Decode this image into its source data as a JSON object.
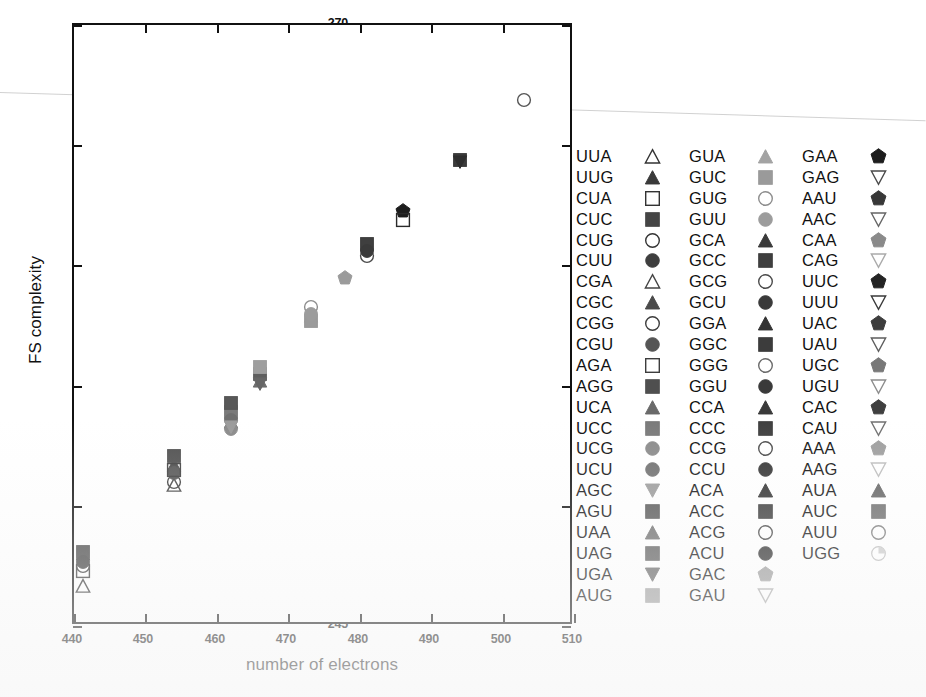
{
  "chart_data": {
    "type": "scatter",
    "title": "",
    "xlabel": "number of electrons",
    "ylabel": "FS complexity",
    "xlim": [
      440,
      510
    ],
    "ylim": [
      245,
      270
    ],
    "xticks": [
      "440",
      "450",
      "460",
      "470",
      "480",
      "490",
      "500",
      "510"
    ],
    "yticks": [
      "245",
      "250",
      "255",
      "260",
      "265",
      "270"
    ],
    "grid": false,
    "legend_position": "right",
    "points": [
      {
        "label": "UUA",
        "x": 441.2,
        "y": 246.6,
        "marker": "triangle-up",
        "fill": "none",
        "stroke": "#333333"
      },
      {
        "label": "UUG",
        "x": 441.2,
        "y": 247.9,
        "marker": "triangle-up",
        "fill": "#3a3a3a",
        "stroke": "#3a3a3a"
      },
      {
        "label": "CUA",
        "x": 441.2,
        "y": 247.2,
        "marker": "square",
        "fill": "none",
        "stroke": "#333333"
      },
      {
        "label": "CUC",
        "x": 441.2,
        "y": 248.0,
        "marker": "square",
        "fill": "#454545",
        "stroke": "#454545"
      },
      {
        "label": "CUG",
        "x": 441.2,
        "y": 247.4,
        "marker": "circle",
        "fill": "none",
        "stroke": "#333333"
      },
      {
        "label": "CUU",
        "x": 441.2,
        "y": 247.6,
        "marker": "circle",
        "fill": "#3e3e3e",
        "stroke": "#3e3e3e"
      },
      {
        "label": "CGA",
        "x": 454.0,
        "y": 250.8,
        "marker": "triangle-up",
        "fill": "none",
        "stroke": "#444444"
      },
      {
        "label": "CGC",
        "x": 454.0,
        "y": 251.6,
        "marker": "triangle-up",
        "fill": "#4a4a4a",
        "stroke": "#4a4a4a"
      },
      {
        "label": "CGG",
        "x": 454.0,
        "y": 250.9,
        "marker": "circle",
        "fill": "none",
        "stroke": "#3d3d3d"
      },
      {
        "label": "CGU",
        "x": 454.0,
        "y": 251.3,
        "marker": "circle",
        "fill": "#555555",
        "stroke": "#555555"
      },
      {
        "label": "AGA",
        "x": 454.0,
        "y": 251.4,
        "marker": "square",
        "fill": "none",
        "stroke": "#3d3d3d"
      },
      {
        "label": "AGG",
        "x": 454.0,
        "y": 252.0,
        "marker": "square",
        "fill": "#4f4f4f",
        "stroke": "#4f4f4f"
      },
      {
        "label": "UCA",
        "x": 462.0,
        "y": 253.4,
        "marker": "triangle-up",
        "fill": "#6a6a6a",
        "stroke": "#6a6a6a"
      },
      {
        "label": "UCC",
        "x": 462.0,
        "y": 253.8,
        "marker": "square",
        "fill": "#7a7a7a",
        "stroke": "#7a7a7a"
      },
      {
        "label": "UCG",
        "x": 462.0,
        "y": 253.1,
        "marker": "circle",
        "fill": "#8a8a8a",
        "stroke": "#8a8a8a"
      },
      {
        "label": "UCU",
        "x": 462.0,
        "y": 253.5,
        "marker": "circle",
        "fill": "#6f6f6f",
        "stroke": "#6f6f6f"
      },
      {
        "label": "AGC",
        "x": 462.0,
        "y": 253.2,
        "marker": "triangle-down",
        "fill": "#9a9a9a",
        "stroke": "#9a9a9a"
      },
      {
        "label": "AGU",
        "x": 462.0,
        "y": 254.2,
        "marker": "square",
        "fill": "#585858",
        "stroke": "#585858"
      },
      {
        "label": "UAA",
        "x": 466.0,
        "y": 255.1,
        "marker": "triangle-up",
        "fill": "#6e6e6e",
        "stroke": "#6e6e6e"
      },
      {
        "label": "UAG",
        "x": 466.0,
        "y": 255.4,
        "marker": "square",
        "fill": "#5e5e5e",
        "stroke": "#5e5e5e"
      },
      {
        "label": "UGA",
        "x": 466.0,
        "y": 255.0,
        "marker": "triangle-down",
        "fill": "#666666",
        "stroke": "#666666"
      },
      {
        "label": "AUG",
        "x": 466.0,
        "y": 255.7,
        "marker": "square",
        "fill": "#9e9e9e",
        "stroke": "#9e9e9e"
      },
      {
        "label": "GUA",
        "x": 473.2,
        "y": 257.8,
        "marker": "triangle-up",
        "fill": "#a3a3a3",
        "stroke": "#a3a3a3"
      },
      {
        "label": "GUC",
        "x": 473.2,
        "y": 257.6,
        "marker": "square",
        "fill": "#9a9a9a",
        "stroke": "#9a9a9a"
      },
      {
        "label": "GUG",
        "x": 473.2,
        "y": 258.2,
        "marker": "circle",
        "fill": "none",
        "stroke": "#8d8d8d"
      },
      {
        "label": "GUU",
        "x": 473.2,
        "y": 257.9,
        "marker": "circle",
        "fill": "#9c9c9c",
        "stroke": "#9c9c9c"
      },
      {
        "label": "GCA",
        "x": 478.0,
        "y": 259.4,
        "marker": "pentagon",
        "fill": "#9b9b9b",
        "stroke": "#9b9b9b"
      },
      {
        "label": "GCC",
        "x": 481.0,
        "y": 260.8,
        "marker": "square",
        "fill": "#3f3f3f",
        "stroke": "#3f3f3f"
      },
      {
        "label": "GCG",
        "x": 481.0,
        "y": 260.3,
        "marker": "circle",
        "fill": "none",
        "stroke": "#4a4a4a"
      },
      {
        "label": "GCU",
        "x": 481.0,
        "y": 260.5,
        "marker": "circle",
        "fill": "#3a3a3a",
        "stroke": "#3a3a3a"
      },
      {
        "label": "GGA",
        "x": 486.0,
        "y": 262.2,
        "marker": "pentagon",
        "fill": "#1d1d1d",
        "stroke": "#1d1d1d"
      },
      {
        "label": "GGC",
        "x": 486.0,
        "y": 261.8,
        "marker": "square",
        "fill": "none",
        "stroke": "#2a2a2a"
      },
      {
        "label": "GGG",
        "x": 494.0,
        "y": 264.3,
        "marker": "square",
        "fill": "#3b3b3b",
        "stroke": "#3b3b3b"
      },
      {
        "label": "GGU",
        "x": 494.0,
        "y": 264.2,
        "marker": "triangle-down",
        "fill": "#2e2e2e",
        "stroke": "#2e2e2e"
      },
      {
        "label": "UGG",
        "x": 503.0,
        "y": 266.8,
        "marker": "circle",
        "fill": "none",
        "stroke": "#555555"
      }
    ]
  },
  "axes": {
    "x_title": "number of electrons",
    "y_title": "FS complexity",
    "x_ticks": [
      "440",
      "450",
      "460",
      "470",
      "480",
      "490",
      "500",
      "510"
    ],
    "y_ticks": [
      "270",
      "265",
      "260",
      "255",
      "250",
      "245"
    ]
  },
  "legend": {
    "columns": [
      {
        "entries": [
          {
            "label": "UUA",
            "marker": "triangle-up",
            "fill": "none",
            "stroke": "#333333"
          },
          {
            "label": "UUG",
            "marker": "triangle-up",
            "fill": "#3a3a3a",
            "stroke": "#3a3a3a"
          },
          {
            "label": "CUA",
            "marker": "square",
            "fill": "none",
            "stroke": "#333333"
          },
          {
            "label": "CUC",
            "marker": "square",
            "fill": "#454545",
            "stroke": "#454545"
          },
          {
            "label": "CUG",
            "marker": "circle",
            "fill": "none",
            "stroke": "#333333"
          },
          {
            "label": "CUU",
            "marker": "circle",
            "fill": "#3e3e3e",
            "stroke": "#3e3e3e"
          },
          {
            "label": "CGA",
            "marker": "triangle-up",
            "fill": "none",
            "stroke": "#444444"
          },
          {
            "label": "CGC",
            "marker": "triangle-up",
            "fill": "#4a4a4a",
            "stroke": "#4a4a4a"
          },
          {
            "label": "CGG",
            "marker": "circle",
            "fill": "none",
            "stroke": "#3d3d3d"
          },
          {
            "label": "CGU",
            "marker": "circle",
            "fill": "#555555",
            "stroke": "#555555"
          },
          {
            "label": "AGA",
            "marker": "square",
            "fill": "none",
            "stroke": "#3d3d3d"
          },
          {
            "label": "AGG",
            "marker": "square",
            "fill": "#4f4f4f",
            "stroke": "#4f4f4f"
          },
          {
            "label": "UCA",
            "marker": "triangle-up",
            "fill": "#6a6a6a",
            "stroke": "#6a6a6a"
          },
          {
            "label": "UCC",
            "marker": "square",
            "fill": "#7a7a7a",
            "stroke": "#7a7a7a"
          },
          {
            "label": "UCG",
            "marker": "circle",
            "fill": "#8a8a8a",
            "stroke": "#8a8a8a"
          },
          {
            "label": "UCU",
            "marker": "circle",
            "fill": "#6f6f6f",
            "stroke": "#6f6f6f"
          },
          {
            "label": "AGC",
            "marker": "triangle-down",
            "fill": "#9a9a9a",
            "stroke": "#9a9a9a"
          },
          {
            "label": "AGU",
            "marker": "square",
            "fill": "#585858",
            "stroke": "#585858"
          },
          {
            "label": "UAA",
            "marker": "triangle-up",
            "fill": "#6e6e6e",
            "stroke": "#6e6e6e"
          },
          {
            "label": "UAG",
            "marker": "square",
            "fill": "#5e5e5e",
            "stroke": "#5e5e5e"
          },
          {
            "label": "UGA",
            "marker": "triangle-down",
            "fill": "#666666",
            "stroke": "#666666"
          },
          {
            "label": "AUG",
            "marker": "square",
            "fill": "#9e9e9e",
            "stroke": "#9e9e9e"
          }
        ]
      },
      {
        "entries": [
          {
            "label": "GUA",
            "marker": "triangle-up",
            "fill": "#a3a3a3",
            "stroke": "#a3a3a3"
          },
          {
            "label": "GUC",
            "marker": "square",
            "fill": "#9a9a9a",
            "stroke": "#9a9a9a"
          },
          {
            "label": "GUG",
            "marker": "circle",
            "fill": "none",
            "stroke": "#8d8d8d"
          },
          {
            "label": "GUU",
            "marker": "circle",
            "fill": "#9c9c9c",
            "stroke": "#9c9c9c"
          },
          {
            "label": "GCA",
            "marker": "triangle-up",
            "fill": "#3a3a3a",
            "stroke": "#3a3a3a"
          },
          {
            "label": "GCC",
            "marker": "square",
            "fill": "#3f3f3f",
            "stroke": "#3f3f3f"
          },
          {
            "label": "GCG",
            "marker": "circle",
            "fill": "none",
            "stroke": "#4a4a4a"
          },
          {
            "label": "GCU",
            "marker": "circle",
            "fill": "#3a3a3a",
            "stroke": "#3a3a3a"
          },
          {
            "label": "GGA",
            "marker": "triangle-up",
            "fill": "#333333",
            "stroke": "#333333"
          },
          {
            "label": "GGC",
            "marker": "square",
            "fill": "#3c3c3c",
            "stroke": "#3c3c3c"
          },
          {
            "label": "GGG",
            "marker": "circle",
            "fill": "none",
            "stroke": "#6a6a6a"
          },
          {
            "label": "GGU",
            "marker": "circle",
            "fill": "#3a3a3a",
            "stroke": "#3a3a3a"
          },
          {
            "label": "CCA",
            "marker": "triangle-up",
            "fill": "#3a3a3a",
            "stroke": "#3a3a3a"
          },
          {
            "label": "CCC",
            "marker": "square",
            "fill": "#3f3f3f",
            "stroke": "#3f3f3f"
          },
          {
            "label": "CCG",
            "marker": "circle",
            "fill": "none",
            "stroke": "#4a4a4a"
          },
          {
            "label": "CCU",
            "marker": "circle",
            "fill": "#333333",
            "stroke": "#333333"
          },
          {
            "label": "ACA",
            "marker": "triangle-up",
            "fill": "#2f2f2f",
            "stroke": "#2f2f2f"
          },
          {
            "label": "ACC",
            "marker": "square",
            "fill": "#3a3a3a",
            "stroke": "#3a3a3a"
          },
          {
            "label": "ACG",
            "marker": "circle",
            "fill": "none",
            "stroke": "#454545"
          },
          {
            "label": "ACU",
            "marker": "circle",
            "fill": "#2e2e2e",
            "stroke": "#2e2e2e"
          },
          {
            "label": "GAC",
            "marker": "pentagon",
            "fill": "#9b9b9b",
            "stroke": "#9b9b9b"
          },
          {
            "label": "GAU",
            "marker": "triangle-down",
            "fill": "none",
            "stroke": "#aaaaaa"
          }
        ]
      },
      {
        "entries": [
          {
            "label": "GAA",
            "marker": "pentagon",
            "fill": "#1d1d1d",
            "stroke": "#1d1d1d"
          },
          {
            "label": "GAG",
            "marker": "triangle-down",
            "fill": "none",
            "stroke": "#4a4a4a"
          },
          {
            "label": "AAU",
            "marker": "pentagon",
            "fill": "#383838",
            "stroke": "#383838"
          },
          {
            "label": "AAC",
            "marker": "triangle-down",
            "fill": "none",
            "stroke": "#666666"
          },
          {
            "label": "CAA",
            "marker": "pentagon",
            "fill": "#8a8a8a",
            "stroke": "#8a8a8a"
          },
          {
            "label": "CAG",
            "marker": "triangle-down",
            "fill": "none",
            "stroke": "#aaaaaa"
          },
          {
            "label": "UUC",
            "marker": "pentagon",
            "fill": "#242424",
            "stroke": "#242424"
          },
          {
            "label": "UUU",
            "marker": "triangle-down",
            "fill": "none",
            "stroke": "#3a3a3a"
          },
          {
            "label": "UAC",
            "marker": "pentagon",
            "fill": "#3d3d3d",
            "stroke": "#3d3d3d"
          },
          {
            "label": "UAU",
            "marker": "triangle-down",
            "fill": "none",
            "stroke": "#5e5e5e"
          },
          {
            "label": "UGC",
            "marker": "pentagon",
            "fill": "#787878",
            "stroke": "#787878"
          },
          {
            "label": "UGU",
            "marker": "triangle-down",
            "fill": "none",
            "stroke": "#8d8d8d"
          },
          {
            "label": "CAC",
            "marker": "pentagon",
            "fill": "#3f3f3f",
            "stroke": "#3f3f3f"
          },
          {
            "label": "CAU",
            "marker": "triangle-down",
            "fill": "none",
            "stroke": "#707070"
          },
          {
            "label": "AAA",
            "marker": "pentagon",
            "fill": "#9e9e9e",
            "stroke": "#9e9e9e"
          },
          {
            "label": "AAG",
            "marker": "triangle-down",
            "fill": "none",
            "stroke": "#bdbdbd"
          },
          {
            "label": "AUA",
            "marker": "triangle-up",
            "fill": "#636363",
            "stroke": "#636363"
          },
          {
            "label": "AUC",
            "marker": "square",
            "fill": "#6d6d6d",
            "stroke": "#6d6d6d"
          },
          {
            "label": "AUU",
            "marker": "circle",
            "fill": "none",
            "stroke": "#7a7a7a"
          },
          {
            "label": "UGG",
            "marker": "circle-partial",
            "fill": "#cccccc",
            "stroke": "#bbbbbb"
          }
        ]
      }
    ]
  }
}
